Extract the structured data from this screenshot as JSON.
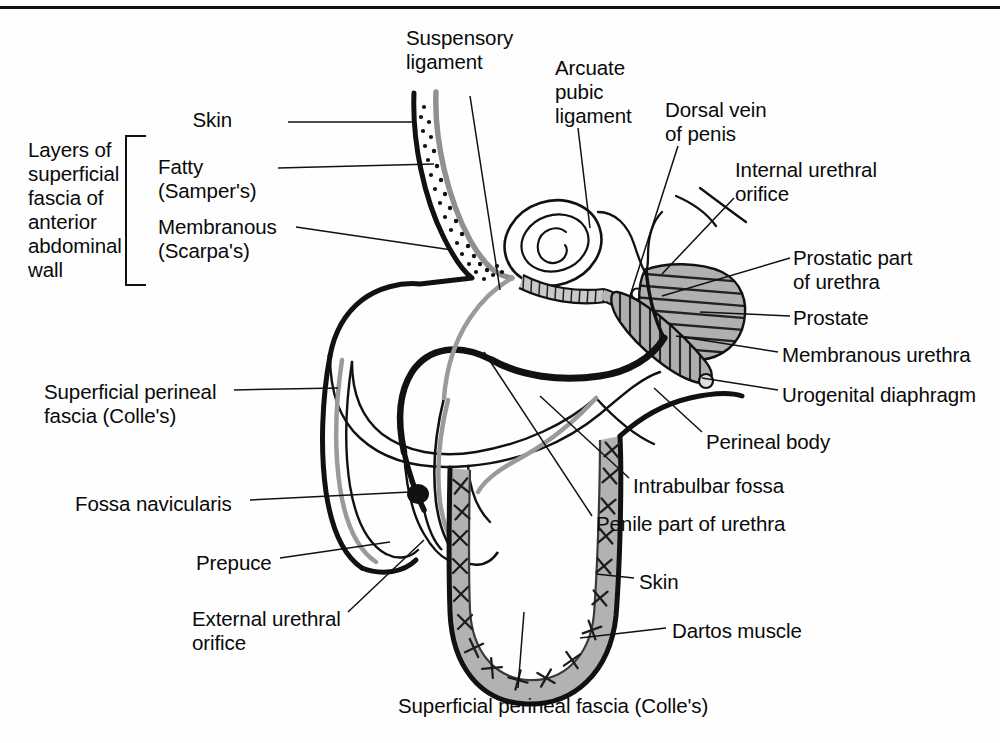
{
  "figure": {
    "type": "anatomical-diagram",
    "background": "#ffffff",
    "ink": "#0a0a0a"
  },
  "colors": {
    "outline_black": "#111111",
    "fascia_gray": "#8e8e8e",
    "shade_gray": "#b3b3b3",
    "hatch_dark": "#2b2b2b",
    "paper": "#ffffff"
  },
  "bracket": {
    "title": "Layers of\nsuperficial\nfascia of\nanterior\nabdominal\nwall",
    "items": [
      "Fatty\n(Samper's)",
      "Membranous\n(Scarpa's)"
    ]
  },
  "labels": [
    {
      "id": "skin-top",
      "text": "Skin",
      "x": 232,
      "y": 108,
      "align": "right"
    },
    {
      "id": "layers-title",
      "text": "Layers of\nsuperficial\nfascia of\nanterior\nabdominal\nwall",
      "x": 28,
      "y": 138,
      "align": "left"
    },
    {
      "id": "fatty-sampers",
      "text": "Fatty\n(Samper's)",
      "x": 158,
      "y": 155,
      "align": "left"
    },
    {
      "id": "membranous-scarpas",
      "text": "Membranous\n(Scarpa's)",
      "x": 158,
      "y": 215,
      "align": "left"
    },
    {
      "id": "suspensory-ligament",
      "text": "Suspensory\nligament",
      "x": 406,
      "y": 26,
      "align": "left"
    },
    {
      "id": "arcuate-pubic-lig",
      "text": "Arcuate\npubic\nligament",
      "x": 555,
      "y": 56,
      "align": "left"
    },
    {
      "id": "dorsal-vein-penis",
      "text": "Dorsal vein\nof penis",
      "x": 665,
      "y": 98,
      "align": "left"
    },
    {
      "id": "internal-urethral-orifice",
      "text": "Internal urethral\norifice",
      "x": 735,
      "y": 158,
      "align": "left"
    },
    {
      "id": "prostatic-part-urethra",
      "text": "Prostatic part\nof urethra",
      "x": 793,
      "y": 246,
      "align": "left"
    },
    {
      "id": "prostate",
      "text": "Prostate",
      "x": 793,
      "y": 306,
      "align": "left"
    },
    {
      "id": "membranous-urethra",
      "text": "Membranous urethra",
      "x": 782,
      "y": 343,
      "align": "left"
    },
    {
      "id": "urogenital-diaphragm",
      "text": "Urogenital diaphragm",
      "x": 782,
      "y": 383,
      "align": "left"
    },
    {
      "id": "perineal-body",
      "text": "Perineal body",
      "x": 706,
      "y": 430,
      "align": "left"
    },
    {
      "id": "intrabulbar-fossa",
      "text": "Intrabulbar fossa",
      "x": 633,
      "y": 474,
      "align": "left"
    },
    {
      "id": "penile-part-urethra",
      "text": "Penile part of urethra",
      "x": 596,
      "y": 512,
      "align": "left"
    },
    {
      "id": "superficial-perineal-fascia-left",
      "text": "Superficial perineal\nfascia (Colle's)",
      "x": 44,
      "y": 380,
      "align": "left"
    },
    {
      "id": "fossa-navicularis",
      "text": "Fossa navicularis",
      "x": 75,
      "y": 492,
      "align": "left"
    },
    {
      "id": "prepuce",
      "text": "Prepuce",
      "x": 196,
      "y": 551,
      "align": "left"
    },
    {
      "id": "external-urethral-orifice",
      "text": "External urethral\norifice",
      "x": 192,
      "y": 607,
      "align": "left"
    },
    {
      "id": "skin-scrotum",
      "text": "Skin",
      "x": 639,
      "y": 570,
      "align": "left"
    },
    {
      "id": "dartos-muscle",
      "text": "Dartos muscle",
      "x": 672,
      "y": 619,
      "align": "left"
    },
    {
      "id": "superficial-perineal-fascia-bottom",
      "text": "Superficial perineal fascia (Colle's)",
      "x": 398,
      "y": 694,
      "align": "left"
    }
  ]
}
